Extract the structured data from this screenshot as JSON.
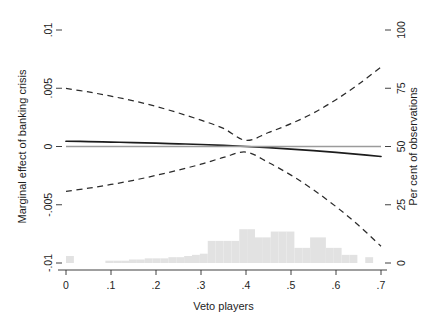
{
  "chart_data": {
    "type": "line",
    "title": "",
    "xlabel": "Veto players",
    "ylabel": "Marginal effect of banking crisis",
    "ylabel_right": "Per cent of observations",
    "xlim": [
      0,
      0.7
    ],
    "ylim": [
      -0.01,
      0.01
    ],
    "ylim_right": [
      0,
      100
    ],
    "grid": false,
    "legend": "none",
    "x_ticks": [
      "0",
      ".1",
      ".2",
      ".3",
      ".4",
      ".5",
      ".6",
      ".7"
    ],
    "x_tick_values": [
      0,
      0.1,
      0.2,
      0.3,
      0.4,
      0.5,
      0.6,
      0.7
    ],
    "y_ticks_left": [
      ".01",
      ".005",
      "0",
      "-.005",
      "-.01"
    ],
    "y_tick_values_left": [
      0.01,
      0.005,
      0,
      -0.005,
      -0.01
    ],
    "y_ticks_right": [
      "100",
      "75",
      "50",
      "25",
      "0"
    ],
    "y_tick_values_right": [
      100,
      75,
      50,
      25,
      0
    ],
    "series": [
      {
        "name": "Marginal effect",
        "style": "solid",
        "color": "#1c1c1c",
        "x": [
          0.0,
          0.05,
          0.1,
          0.15,
          0.2,
          0.25,
          0.3,
          0.35,
          0.4,
          0.45,
          0.5,
          0.55,
          0.6,
          0.65,
          0.7
        ],
        "values": [
          0.00045,
          0.00042,
          0.00038,
          0.00034,
          0.00029,
          0.00023,
          0.00017,
          9e-05,
          0.0,
          -0.0001,
          -0.00022,
          -0.00036,
          -0.00051,
          -0.00068,
          -0.00086
        ]
      },
      {
        "name": "Upper 95% confidence bound",
        "style": "dashed",
        "color": "#2b2b2b",
        "x": [
          0.0,
          0.05,
          0.1,
          0.15,
          0.2,
          0.25,
          0.3,
          0.35,
          0.4,
          0.45,
          0.5,
          0.55,
          0.6,
          0.65,
          0.7
        ],
        "values": [
          0.00498,
          0.00468,
          0.00432,
          0.00392,
          0.00344,
          0.00288,
          0.00226,
          0.00155,
          0.00052,
          0.0012,
          0.00196,
          0.00288,
          0.00402,
          0.00534,
          0.00682
        ]
      },
      {
        "name": "Lower 95% confidence bound",
        "style": "dashed",
        "color": "#2b2b2b",
        "x": [
          0.0,
          0.05,
          0.1,
          0.15,
          0.2,
          0.25,
          0.3,
          0.35,
          0.4,
          0.45,
          0.5,
          0.55,
          0.6,
          0.65,
          0.7
        ],
        "values": [
          -0.00386,
          -0.00358,
          -0.00326,
          -0.0029,
          -0.00248,
          -0.00202,
          -0.00152,
          -0.00094,
          -0.00048,
          -0.00138,
          -0.00246,
          -0.00372,
          -0.00516,
          -0.00676,
          -0.00856
        ]
      },
      {
        "name": "Zero reference line",
        "style": "solid-grey",
        "color": "#9b9b9b",
        "x": [
          0.0,
          0.7
        ],
        "values": [
          0.0,
          0.0
        ]
      }
    ],
    "histogram": {
      "name": "Distribution of observations",
      "color": "#e2e2e2",
      "axis": "right",
      "bin_width": 0.0175,
      "bins": [
        {
          "x": 0.0,
          "percent": 3.0
        },
        {
          "x": 0.0175,
          "percent": 0.0
        },
        {
          "x": 0.035,
          "percent": 0.0
        },
        {
          "x": 0.0525,
          "percent": 0.0
        },
        {
          "x": 0.07,
          "percent": 0.0
        },
        {
          "x": 0.0875,
          "percent": 1.0
        },
        {
          "x": 0.105,
          "percent": 1.0
        },
        {
          "x": 0.1225,
          "percent": 1.0
        },
        {
          "x": 0.14,
          "percent": 1.5
        },
        {
          "x": 0.1575,
          "percent": 1.5
        },
        {
          "x": 0.175,
          "percent": 2.0
        },
        {
          "x": 0.1925,
          "percent": 2.0
        },
        {
          "x": 0.21,
          "percent": 2.0
        },
        {
          "x": 0.2275,
          "percent": 2.5
        },
        {
          "x": 0.245,
          "percent": 2.5
        },
        {
          "x": 0.2625,
          "percent": 3.0
        },
        {
          "x": 0.28,
          "percent": 3.5
        },
        {
          "x": 0.2975,
          "percent": 4.0
        },
        {
          "x": 0.315,
          "percent": 9.5
        },
        {
          "x": 0.3325,
          "percent": 9.5
        },
        {
          "x": 0.35,
          "percent": 9.5
        },
        {
          "x": 0.3675,
          "percent": 9.5
        },
        {
          "x": 0.385,
          "percent": 14.5
        },
        {
          "x": 0.4025,
          "percent": 14.5
        },
        {
          "x": 0.42,
          "percent": 11.0
        },
        {
          "x": 0.4375,
          "percent": 11.0
        },
        {
          "x": 0.455,
          "percent": 13.5
        },
        {
          "x": 0.4725,
          "percent": 13.5
        },
        {
          "x": 0.49,
          "percent": 13.5
        },
        {
          "x": 0.5075,
          "percent": 6.5
        },
        {
          "x": 0.525,
          "percent": 6.5
        },
        {
          "x": 0.5425,
          "percent": 11.0
        },
        {
          "x": 0.56,
          "percent": 11.0
        },
        {
          "x": 0.5775,
          "percent": 6.5
        },
        {
          "x": 0.595,
          "percent": 6.5
        },
        {
          "x": 0.6125,
          "percent": 3.5
        },
        {
          "x": 0.63,
          "percent": 3.5
        },
        {
          "x": 0.6475,
          "percent": 0.0
        },
        {
          "x": 0.665,
          "percent": 2.5
        },
        {
          "x": 0.6825,
          "percent": 0.0
        }
      ]
    }
  }
}
